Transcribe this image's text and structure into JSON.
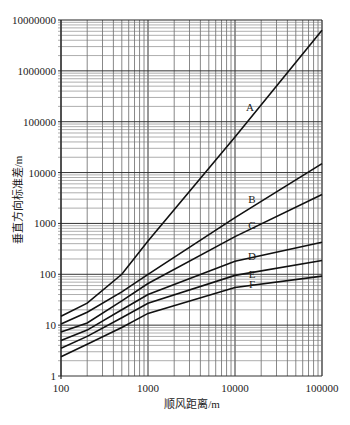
{
  "chart_data": {
    "type": "line",
    "title": "",
    "xlabel": "顺风距离/m",
    "ylabel": "垂直方向标准差/m",
    "xscale": "log",
    "yscale": "log",
    "xlim": [
      100,
      100000
    ],
    "ylim": [
      1,
      10000000
    ],
    "grid": true,
    "x_ticks": [
      "100",
      "1000",
      "10000",
      "100000"
    ],
    "y_ticks": [
      "1",
      "10",
      "100",
      "1000",
      "10000",
      "100000",
      "1000000",
      "10000000"
    ],
    "x": [
      100,
      200,
      500,
      1000,
      10000,
      100000
    ],
    "series": [
      {
        "name": "A",
        "values": [
          15,
          27,
          100,
          450,
          50000,
          6300000
        ],
        "label_pos": [
          250,
          111
        ]
      },
      {
        "name": "B",
        "values": [
          10.5,
          18,
          45,
          100,
          1300,
          15000
        ],
        "label_pos": [
          252,
          203
        ]
      },
      {
        "name": "C",
        "values": [
          7.3,
          11,
          30,
          66,
          550,
          3700
        ],
        "label_pos": [
          252,
          229
        ]
      },
      {
        "name": "D",
        "values": [
          5,
          8,
          20,
          40,
          180,
          425
        ],
        "label_pos": [
          252,
          260
        ]
      },
      {
        "name": "E",
        "values": [
          3.5,
          6,
          14,
          27,
          95,
          187
        ],
        "label_pos": [
          252,
          278
        ]
      },
      {
        "name": "F",
        "values": [
          2.4,
          4.2,
          9,
          17,
          55,
          92
        ],
        "label_pos": [
          252,
          288
        ]
      }
    ]
  }
}
